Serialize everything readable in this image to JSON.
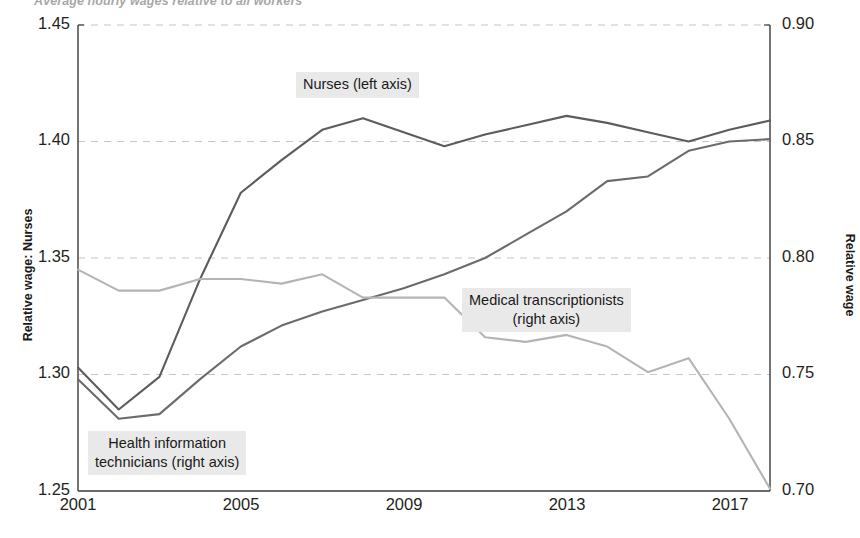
{
  "figure": {
    "title": "Average hourly wages relative to all workers"
  },
  "axes": {
    "left_title": "Relative wage: Nurses",
    "right_title": "Relative wage",
    "left_ticks": [
      "1.25",
      "1.30",
      "1.35",
      "1.40",
      "1.45"
    ],
    "right_ticks": [
      "0.70",
      "0.75",
      "0.80",
      "0.85",
      "0.90"
    ],
    "x_ticks": [
      "2001",
      "2005",
      "2009",
      "2013",
      "2017"
    ]
  },
  "annotations": {
    "nurses": "Nurses (left axis)",
    "transcriptionists": "Medical transcriptionists\n(right axis)",
    "technicians": "Health information\ntechnicians (right axis)"
  },
  "colors": {
    "nurses_line": "#5c5c5c",
    "technicians_line": "#6b6b6b",
    "transcriptionists_line": "#b4b4b4",
    "grid": "#c9c2cf",
    "axis": "#3a3a3a",
    "annotation_background": "#e9e9e9"
  },
  "chart_data": {
    "type": "line",
    "title": "Average hourly wages relative to all workers",
    "xlabel": "",
    "ylabel": "Relative wage: Nurses",
    "ylabel_right": "Relative wage",
    "x": [
      2001,
      2002,
      2003,
      2004,
      2005,
      2006,
      2007,
      2008,
      2009,
      2010,
      2011,
      2012,
      2013,
      2014,
      2015,
      2016,
      2017,
      2018
    ],
    "xlim": [
      2001,
      2018
    ],
    "ylim": [
      1.25,
      1.45
    ],
    "ylim_right": [
      0.7,
      0.9
    ],
    "xticks": [
      2001,
      2005,
      2009,
      2013,
      2017
    ],
    "yticks_left": [
      1.25,
      1.3,
      1.35,
      1.4,
      1.45
    ],
    "yticks_right": [
      0.7,
      0.75,
      0.8,
      0.85,
      0.9
    ],
    "grid": "horizontal-dashed",
    "legend": "inline-annotations",
    "series": [
      {
        "name": "Nurses (left axis)",
        "axis": "left",
        "color": "#5c5c5c",
        "values": [
          1.303,
          1.285,
          1.299,
          1.341,
          1.378,
          1.392,
          1.405,
          1.41,
          1.404,
          1.398,
          1.403,
          1.407,
          1.411,
          1.408,
          1.404,
          1.4,
          1.405,
          1.409
        ]
      },
      {
        "name": "Health information technicians (right axis)",
        "axis": "right",
        "color": "#6b6b6b",
        "values": [
          0.748,
          0.731,
          0.733,
          0.748,
          0.762,
          0.771,
          0.777,
          0.782,
          0.787,
          0.793,
          0.8,
          0.81,
          0.82,
          0.833,
          0.835,
          0.846,
          0.85,
          0.851
        ]
      },
      {
        "name": "Medical transcriptionists (right axis)",
        "axis": "right",
        "color": "#b4b4b4",
        "values": [
          0.795,
          0.786,
          0.786,
          0.791,
          0.791,
          0.789,
          0.793,
          0.783,
          0.783,
          0.783,
          0.766,
          0.764,
          0.767,
          0.762,
          0.751,
          0.757,
          0.731,
          0.701
        ]
      }
    ]
  }
}
